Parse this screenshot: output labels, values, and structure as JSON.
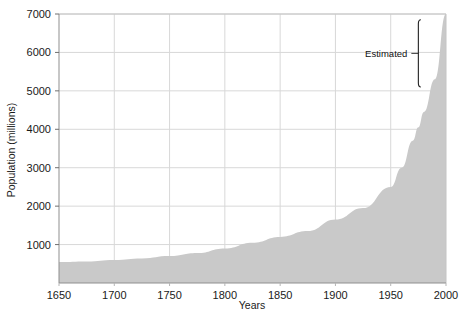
{
  "chart_data": {
    "type": "area",
    "title": "",
    "xlabel": "Years",
    "ylabel": "Population (millions)",
    "xlim": [
      1650,
      2000
    ],
    "ylim": [
      0,
      7000
    ],
    "grid": true,
    "legend": null,
    "x_ticks": [
      1650,
      1700,
      1750,
      1800,
      1850,
      1900,
      1950,
      2000
    ],
    "y_ticks": [
      1000,
      2000,
      3000,
      4000,
      5000,
      6000,
      7000
    ],
    "x_tick_labels": [
      "1650",
      "1700",
      "1750",
      "1800",
      "1850",
      "1900",
      "1950",
      "2000"
    ],
    "y_tick_labels": [
      "1000",
      "2000",
      "3000",
      "4000",
      "5000",
      "6000",
      "7000"
    ],
    "series": [
      {
        "name": "World population",
        "fill_color": "#c9c9c9",
        "x": [
          1650,
          1675,
          1700,
          1725,
          1750,
          1775,
          1800,
          1825,
          1850,
          1875,
          1900,
          1925,
          1950,
          1960,
          1970,
          1975,
          1980,
          1990,
          2000
        ],
        "values": [
          545,
          560,
          600,
          640,
          700,
          780,
          900,
          1050,
          1200,
          1350,
          1650,
          1950,
          2500,
          3000,
          3700,
          4050,
          4450,
          5300,
          7000
        ]
      }
    ],
    "annotations": [
      {
        "text": "Estimated",
        "x_start": 1975,
        "x_end": 2000,
        "y_start": 6850,
        "y_end": 5100,
        "label_x": 1942,
        "label_y": 6050,
        "marker": "vertical-bracket"
      }
    ],
    "colors": {
      "area_fill": "#c9c9c9",
      "grid": "#d8d8d8",
      "axis": "#9a9a9a",
      "text": "#1a1a1a",
      "background": "#ffffff"
    }
  }
}
